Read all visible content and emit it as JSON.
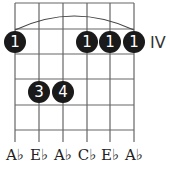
{
  "chord_diagram": {
    "fret_position": "IV",
    "strings": 6,
    "frets_shown": 5,
    "barre": {
      "fret": 1,
      "from_string": 1,
      "to_string": 6,
      "finger": "1"
    },
    "dots": [
      {
        "string": 1,
        "fret": 1,
        "finger": "1"
      },
      {
        "string": 4,
        "fret": 1,
        "finger": "1"
      },
      {
        "string": 5,
        "fret": 1,
        "finger": "1"
      },
      {
        "string": 6,
        "fret": 1,
        "finger": "1"
      },
      {
        "string": 2,
        "fret": 3,
        "finger": "3"
      },
      {
        "string": 3,
        "fret": 3,
        "finger": "4"
      }
    ],
    "notes": [
      "A♭",
      "E♭",
      "A♭",
      "C♭",
      "E♭",
      "A♭"
    ],
    "colors": {
      "dot": "#1a1a1a",
      "line": "#555555",
      "text": "#222222"
    }
  }
}
